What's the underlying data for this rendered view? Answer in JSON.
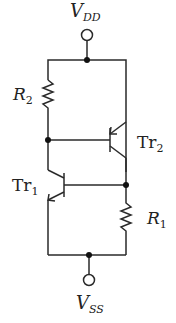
{
  "diagram": {
    "type": "circuit",
    "labels": {
      "vdd": {
        "main": "V",
        "sub": "DD"
      },
      "vss": {
        "main": "V",
        "sub": "SS"
      },
      "r1": {
        "main": "R",
        "sub": "1"
      },
      "r2": {
        "main": "R",
        "sub": "2"
      },
      "tr1": {
        "main": "Tr",
        "sub": "1"
      },
      "tr2": {
        "main": "Tr",
        "sub": "2"
      }
    },
    "colors": {
      "line": "#2a2a2a",
      "background": "#ffffff"
    }
  }
}
